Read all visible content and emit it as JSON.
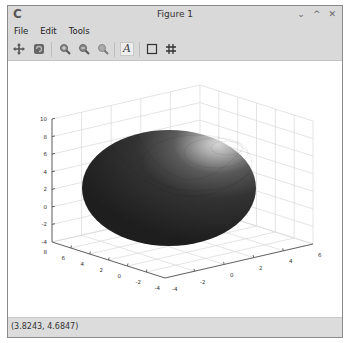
{
  "window": {
    "title": "Figure 1",
    "app_icon": "octave-icon",
    "controls": {
      "minimize": "⌄",
      "maximize": "^",
      "close": "✕"
    }
  },
  "menubar": {
    "items": [
      {
        "label": "File"
      },
      {
        "label": "Edit"
      },
      {
        "label": "Tools"
      }
    ]
  },
  "toolbar": {
    "buttons": [
      {
        "name": "pan-icon",
        "glyph": "✥"
      },
      {
        "name": "rotate-icon",
        "glyph": "↻"
      },
      {
        "name": "zoom-in-icon",
        "glyph": "+"
      },
      {
        "name": "zoom-out-icon",
        "glyph": "−"
      },
      {
        "name": "zoom-reset-icon",
        "glyph": "⌕"
      },
      {
        "name": "text-insert-icon",
        "glyph": "A"
      },
      {
        "name": "toggle-axes-icon",
        "glyph": "□"
      },
      {
        "name": "toggle-grid-icon",
        "glyph": "#"
      }
    ]
  },
  "axes": {
    "z_ticks": [
      "10",
      "8",
      "6",
      "4",
      "2",
      "0",
      "-2",
      "-4"
    ],
    "y_ticks_left": [
      "8",
      "6",
      "4",
      "2",
      "0",
      "-2",
      "-4"
    ],
    "x_ticks_right": [
      "-4",
      "-2",
      "0",
      "2",
      "4",
      "6"
    ],
    "surface_color": "#2b2b2b",
    "highlight_color": "#bdbdbd",
    "grid_color": "#d8d8d8",
    "axis_color": "#444444"
  },
  "statusbar": {
    "coordinates": "(3.8243, 4.6847)"
  }
}
